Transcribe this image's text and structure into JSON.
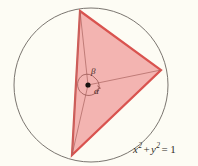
{
  "figure": {
    "name": "unit-circle-inscribed-triangle",
    "background_color": "#fdfcf4",
    "width": 198,
    "height": 166
  },
  "circle": {
    "label": "unit-circle",
    "cx": 91,
    "cy": 85,
    "r": 77,
    "stroke_color": "#6b6560",
    "stroke_width": 0.9,
    "fill": "none"
  },
  "center_point": {
    "label": "origin-dot",
    "cx": 88,
    "cy": 85,
    "r": 2.6,
    "color": "#17120f"
  },
  "triangle": {
    "label": "inscribed-triangle",
    "fill_color": "#f3b4b1",
    "stroke_color": "#d9534f",
    "stroke_width": 2.2,
    "vertices": [
      {
        "name": "top-vertex",
        "x": 80,
        "y": 11
      },
      {
        "name": "right-vertex",
        "x": 161,
        "y": 70
      },
      {
        "name": "bottom-vertex",
        "x": 72,
        "y": 155
      }
    ]
  },
  "chords": [
    {
      "name": "vertical-chord",
      "x1": 80,
      "y1": 11,
      "x2": 72,
      "y2": 155,
      "stroke_color": "#b3706c",
      "stroke_width": 0.7
    },
    {
      "name": "radius-to-right-vertex",
      "x1": 88,
      "y1": 85,
      "x2": 161,
      "y2": 70,
      "stroke_color": "#a9635f",
      "stroke_width": 0.7
    },
    {
      "name": "radius-to-top-vertex",
      "x1": 88,
      "y1": 85,
      "x2": 80,
      "y2": 11,
      "stroke_color": "#a9635f",
      "stroke_width": 0.7
    },
    {
      "name": "radius-to-bottom-vertex",
      "x1": 88,
      "y1": 85,
      "x2": 72,
      "y2": 155,
      "stroke_color": "#a9635f",
      "stroke_width": 0.7
    }
  ],
  "angle_arcs": [
    {
      "name": "alpha-arc",
      "path": "M 99 88 A 11 11 0 0 0 95 78",
      "stroke_color": "#8d4a46"
    },
    {
      "name": "beta-arc",
      "path": "M 95 78 A 11 11 0 0 0 83 75",
      "stroke_color": "#8d4a46"
    },
    {
      "name": "reflex-arc",
      "path": "M 83 75 A 11 11 0 1 0 99 88",
      "stroke_color": "#8d4a46"
    }
  ],
  "arc_arrowhead": {
    "name": "arc-arrow",
    "path": "M 97 89.5 L 100.5 88.2 L 97.6 86",
    "stroke_color": "#8d4a46"
  },
  "labels": {
    "alpha": "α",
    "beta": "β"
  },
  "equation": {
    "name": "circle-equation",
    "x_var": "x",
    "x_exp": "2",
    "plus": "+",
    "y_var": "y",
    "y_exp": "2",
    "equals": "=",
    "rhs": "1",
    "full_text": "x² + y² = 1"
  }
}
